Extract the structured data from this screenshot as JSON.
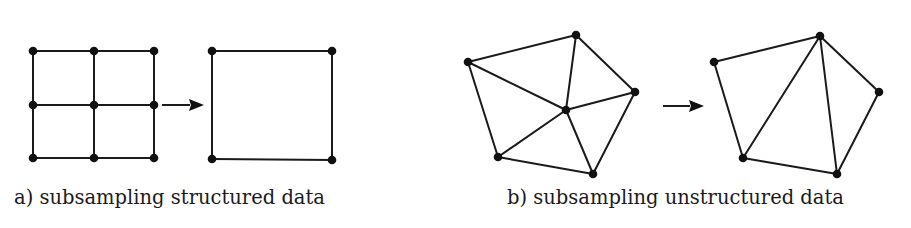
{
  "figure": {
    "panels": [
      {
        "id": "a",
        "caption": "a) subsampling structured data",
        "caption_pos": {
          "x": 14,
          "y": 204
        },
        "before": {
          "type": "structured-grid",
          "nodes": [
            [
              33,
              51
            ],
            [
              94,
              51
            ],
            [
              154,
              51
            ],
            [
              33,
              105
            ],
            [
              94,
              105
            ],
            [
              154,
              105
            ],
            [
              33,
              158
            ],
            [
              94,
              158
            ],
            [
              154,
              158
            ]
          ],
          "edges": [
            [
              0,
              1
            ],
            [
              1,
              2
            ],
            [
              3,
              4
            ],
            [
              4,
              5
            ],
            [
              6,
              7
            ],
            [
              7,
              8
            ],
            [
              0,
              3
            ],
            [
              3,
              6
            ],
            [
              1,
              4
            ],
            [
              4,
              7
            ],
            [
              2,
              5
            ],
            [
              5,
              8
            ]
          ]
        },
        "arrow": {
          "x1": 162,
          "y": 105,
          "x2": 204
        },
        "after": {
          "type": "structured-grid",
          "nodes": [
            [
              212,
              51
            ],
            [
              332,
              51
            ],
            [
              212,
              159
            ],
            [
              332,
              160
            ]
          ],
          "edges": [
            [
              0,
              1
            ],
            [
              1,
              3
            ],
            [
              3,
              2
            ],
            [
              2,
              0
            ]
          ]
        }
      },
      {
        "id": "b",
        "caption": "b) subsampling unstructured data",
        "caption_pos": {
          "x": 507,
          "y": 204
        },
        "before": {
          "type": "unstructured-mesh",
          "nodes": [
            [
              468,
              62
            ],
            [
              576,
              35
            ],
            [
              635,
              92
            ],
            [
              566,
              110
            ],
            [
              498,
              157
            ],
            [
              593,
              174
            ]
          ],
          "edges": [
            [
              0,
              1
            ],
            [
              1,
              2
            ],
            [
              2,
              5
            ],
            [
              5,
              4
            ],
            [
              4,
              0
            ],
            [
              0,
              3
            ],
            [
              1,
              3
            ],
            [
              2,
              3
            ],
            [
              4,
              3
            ],
            [
              5,
              3
            ]
          ]
        },
        "arrow": {
          "x1": 663,
          "y": 106,
          "x2": 704
        },
        "after": {
          "type": "unstructured-mesh",
          "nodes": [
            [
              714,
              62
            ],
            [
              820,
              36
            ],
            [
              879,
              92
            ],
            [
              743,
              158
            ],
            [
              837,
              174
            ]
          ],
          "edges": [
            [
              0,
              1
            ],
            [
              1,
              2
            ],
            [
              2,
              4
            ],
            [
              4,
              3
            ],
            [
              3,
              0
            ],
            [
              3,
              1
            ],
            [
              1,
              4
            ]
          ]
        }
      }
    ]
  }
}
